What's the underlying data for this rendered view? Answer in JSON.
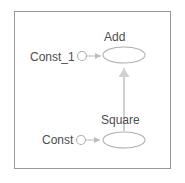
{
  "diagram": {
    "background_color": "#ffffff",
    "frame_color": "#9a9a9a",
    "edge_color": "#bcbcbc",
    "node_stroke_color": "#b0b0b0",
    "label_color": "#4d4d4d",
    "nodes": [
      {
        "id": "add",
        "label": "Add",
        "shape": "ellipse",
        "cx": 124,
        "cy": 55,
        "rx": 21,
        "ry": 8,
        "label_position": "above"
      },
      {
        "id": "square",
        "label": "Square",
        "shape": "ellipse",
        "cx": 124,
        "cy": 140,
        "rx": 21,
        "ry": 8,
        "label_position": "above"
      },
      {
        "id": "const_1",
        "label": "Const_1",
        "shape": "circle",
        "cx": 82,
        "cy": 56,
        "r": 4.5,
        "label_position": "left"
      },
      {
        "id": "const",
        "label": "Const",
        "shape": "circle",
        "cx": 81,
        "cy": 140,
        "r": 4.5,
        "label_position": "left"
      }
    ],
    "edges": [
      {
        "id": "const1-to-add",
        "from": "const_1",
        "to": "add",
        "direction": "right",
        "arrowhead": "filled-triangle"
      },
      {
        "id": "const-to-square",
        "from": "const",
        "to": "square",
        "direction": "right",
        "arrowhead": "filled-triangle"
      },
      {
        "id": "square-to-add",
        "from": "square",
        "to": "add",
        "direction": "up",
        "arrowhead": "filled-triangle"
      }
    ]
  }
}
